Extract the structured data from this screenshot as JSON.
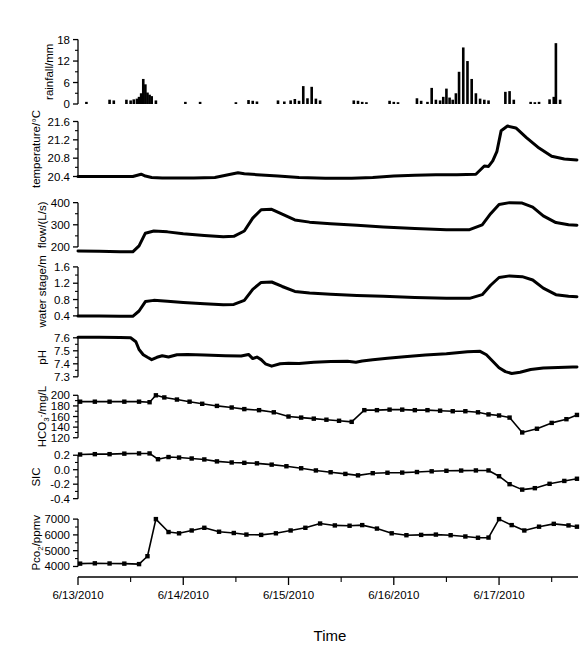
{
  "figure": {
    "time_axis_title": "Time",
    "x_tick_labels": [
      "6/13/2010",
      "6/14/2010",
      "6/15/2010",
      "6/16/2010",
      "6/17/2010"
    ],
    "x_minor_ticks_per_interval": 2
  },
  "chart_data": [
    {
      "type": "bar",
      "title": "",
      "ylabel": "rainfall/mm",
      "xlabel": "Time",
      "ytick_labels": [
        "0",
        "6",
        "12",
        "18"
      ],
      "yticks": [
        0,
        6,
        12,
        18
      ],
      "ylim": [
        0,
        19
      ],
      "xlim": [
        0,
        4.75
      ],
      "grid": false,
      "x": [
        0.08,
        0.3,
        0.34,
        0.46,
        0.5,
        0.53,
        0.56,
        0.58,
        0.6,
        0.62,
        0.64,
        0.66,
        0.68,
        0.7,
        0.74,
        1.02,
        1.16,
        1.5,
        1.62,
        1.66,
        1.7,
        1.9,
        1.96,
        2.02,
        2.06,
        2.1,
        2.14,
        2.18,
        2.22,
        2.26,
        2.3,
        2.62,
        2.66,
        2.7,
        2.74,
        2.96,
        3.0,
        3.04,
        3.22,
        3.26,
        3.32,
        3.36,
        3.4,
        3.44,
        3.47,
        3.5,
        3.53,
        3.56,
        3.59,
        3.62,
        3.66,
        3.7,
        3.74,
        3.78,
        3.82,
        3.86,
        3.9,
        4.06,
        4.1,
        4.14,
        4.3,
        4.34,
        4.38,
        4.48,
        4.52,
        4.54,
        4.58
      ],
      "values": [
        0.6,
        1.2,
        1.0,
        1.2,
        1.0,
        1.3,
        1.5,
        2.0,
        3.0,
        7.0,
        5.5,
        3.2,
        2.6,
        2.2,
        1.0,
        0.6,
        0.6,
        0.5,
        1.1,
        0.9,
        0.7,
        1.0,
        0.7,
        1.0,
        1.4,
        0.9,
        5.0,
        1.6,
        4.8,
        1.5,
        1.0,
        1.0,
        0.9,
        0.6,
        0.5,
        0.9,
        0.6,
        0.5,
        1.6,
        0.9,
        0.6,
        4.5,
        1.2,
        1.0,
        2.0,
        4.3,
        1.8,
        1.2,
        3.0,
        9.0,
        15.8,
        12.0,
        7.0,
        3.0,
        1.5,
        1.2,
        1.0,
        3.4,
        3.6,
        1.2,
        0.6,
        0.5,
        0.6,
        1.3,
        2.0,
        17.0,
        1.2
      ]
    },
    {
      "type": "line",
      "title": "",
      "ylabel": "temperature/°C",
      "ytick_labels": [
        "20.4",
        "20.8",
        "21.2",
        "21.6"
      ],
      "yticks": [
        20.4,
        20.8,
        21.2,
        21.6
      ],
      "ylim": [
        20.28,
        21.72
      ],
      "xlim": [
        0,
        4.75
      ],
      "grid": false,
      "x": [
        0.0,
        0.3,
        0.52,
        0.6,
        0.64,
        0.7,
        0.8,
        0.95,
        1.1,
        1.3,
        1.45,
        1.52,
        1.58,
        1.7,
        1.9,
        2.1,
        2.35,
        2.6,
        2.8,
        3.0,
        3.2,
        3.4,
        3.6,
        3.78,
        3.86,
        3.9,
        3.94,
        3.98,
        4.02,
        4.08,
        4.16,
        4.26,
        4.38,
        4.5,
        4.62,
        4.74
      ],
      "values": [
        20.4,
        20.4,
        20.4,
        20.45,
        20.41,
        20.38,
        20.37,
        20.37,
        20.37,
        20.38,
        20.45,
        20.48,
        20.46,
        20.44,
        20.41,
        20.38,
        20.36,
        20.36,
        20.38,
        20.41,
        20.43,
        20.44,
        20.44,
        20.45,
        20.63,
        20.62,
        20.74,
        20.95,
        21.4,
        21.5,
        21.46,
        21.25,
        21.02,
        20.84,
        20.78,
        20.76
      ]
    },
    {
      "type": "line",
      "title": "",
      "ylabel": "flow/(L/s)",
      "ytick_labels": [
        "200",
        "300",
        "400"
      ],
      "yticks": [
        200,
        300,
        400
      ],
      "ylim": [
        150,
        430
      ],
      "xlim": [
        0,
        4.75
      ],
      "grid": false,
      "x": [
        0.0,
        0.2,
        0.4,
        0.52,
        0.58,
        0.64,
        0.72,
        0.85,
        1.0,
        1.2,
        1.38,
        1.48,
        1.58,
        1.66,
        1.74,
        1.84,
        1.94,
        2.06,
        2.2,
        2.4,
        2.65,
        2.9,
        3.2,
        3.5,
        3.72,
        3.84,
        3.92,
        4.0,
        4.1,
        4.22,
        4.32,
        4.42,
        4.54,
        4.66,
        4.74
      ],
      "values": [
        182,
        180,
        178,
        178,
        205,
        262,
        272,
        268,
        260,
        252,
        246,
        248,
        272,
        330,
        368,
        370,
        348,
        322,
        312,
        305,
        298,
        290,
        283,
        278,
        278,
        300,
        350,
        392,
        400,
        398,
        380,
        340,
        310,
        300,
        298
      ]
    },
    {
      "type": "line",
      "title": "",
      "ylabel": "water stage/m",
      "ytick_labels": [
        "0.4",
        "0.8",
        "1.2",
        "1.6"
      ],
      "yticks": [
        0.4,
        0.8,
        1.2,
        1.6
      ],
      "ylim": [
        0.25,
        1.72
      ],
      "xlim": [
        0,
        4.75
      ],
      "grid": false,
      "x": [
        0.0,
        0.2,
        0.4,
        0.52,
        0.58,
        0.64,
        0.72,
        0.85,
        1.0,
        1.2,
        1.38,
        1.48,
        1.58,
        1.66,
        1.74,
        1.84,
        1.94,
        2.06,
        2.2,
        2.4,
        2.65,
        2.9,
        3.2,
        3.5,
        3.72,
        3.84,
        3.92,
        4.0,
        4.1,
        4.22,
        4.32,
        4.42,
        4.54,
        4.66,
        4.74
      ],
      "values": [
        0.4,
        0.4,
        0.39,
        0.39,
        0.52,
        0.75,
        0.78,
        0.76,
        0.73,
        0.7,
        0.67,
        0.68,
        0.78,
        1.05,
        1.22,
        1.23,
        1.12,
        1.0,
        0.96,
        0.93,
        0.9,
        0.88,
        0.85,
        0.83,
        0.83,
        0.92,
        1.15,
        1.34,
        1.38,
        1.36,
        1.28,
        1.08,
        0.92,
        0.88,
        0.87
      ]
    },
    {
      "type": "line",
      "title": "",
      "ylabel": "pH",
      "ytick_labels": [
        "7.3",
        "7.4",
        "7.5",
        "7.6"
      ],
      "yticks": [
        7.3,
        7.4,
        7.5,
        7.6
      ],
      "ylim": [
        7.26,
        7.66
      ],
      "xlim": [
        0,
        4.75
      ],
      "grid": false,
      "x": [
        0.0,
        0.2,
        0.4,
        0.5,
        0.55,
        0.58,
        0.62,
        0.66,
        0.7,
        0.75,
        0.8,
        0.86,
        0.94,
        1.04,
        1.2,
        1.4,
        1.55,
        1.62,
        1.66,
        1.7,
        1.74,
        1.78,
        1.84,
        1.92,
        2.0,
        2.1,
        2.24,
        2.4,
        2.56,
        2.64,
        2.7,
        2.8,
        2.94,
        3.1,
        3.3,
        3.5,
        3.7,
        3.82,
        3.88,
        3.94,
        4.0,
        4.06,
        4.12,
        4.2,
        4.3,
        4.42,
        4.56,
        4.7,
        4.74
      ],
      "values": [
        7.605,
        7.605,
        7.603,
        7.6,
        7.57,
        7.51,
        7.47,
        7.45,
        7.432,
        7.45,
        7.462,
        7.452,
        7.47,
        7.472,
        7.468,
        7.462,
        7.46,
        7.472,
        7.44,
        7.452,
        7.432,
        7.4,
        7.382,
        7.4,
        7.405,
        7.402,
        7.412,
        7.418,
        7.42,
        7.412,
        7.422,
        7.432,
        7.442,
        7.455,
        7.468,
        7.478,
        7.492,
        7.496,
        7.47,
        7.42,
        7.37,
        7.34,
        7.325,
        7.335,
        7.356,
        7.368,
        7.372,
        7.375,
        7.376
      ]
    },
    {
      "type": "line",
      "title": "",
      "ylabel": "HCO3-/mg/L",
      "ytick_labels": [
        "120",
        "140",
        "160",
        "180",
        "200"
      ],
      "yticks": [
        120,
        140,
        160,
        180,
        200
      ],
      "ylim": [
        112,
        210
      ],
      "xlim": [
        0,
        4.75
      ],
      "grid": false,
      "markers": true,
      "x": [
        0.02,
        0.16,
        0.3,
        0.44,
        0.58,
        0.68,
        0.74,
        0.82,
        0.94,
        1.06,
        1.18,
        1.32,
        1.46,
        1.58,
        1.72,
        1.86,
        2.0,
        2.12,
        2.24,
        2.36,
        2.48,
        2.6,
        2.72,
        2.84,
        2.96,
        3.08,
        3.2,
        3.32,
        3.44,
        3.56,
        3.68,
        3.8,
        3.9,
        4.0,
        4.1,
        4.22,
        4.36,
        4.5,
        4.64,
        4.74
      ],
      "values": [
        188,
        188,
        188,
        188,
        188,
        187,
        200,
        196,
        192,
        188,
        184,
        180,
        177,
        174,
        172,
        168,
        160,
        158,
        156,
        154,
        152,
        150,
        172,
        172,
        173,
        173,
        172,
        172,
        171,
        170,
        170,
        168,
        164,
        162,
        158,
        130,
        137,
        148,
        155,
        163
      ]
    },
    {
      "type": "line",
      "title": "",
      "ylabel": "SIC",
      "ytick_labels": [
        "-0.4",
        "-0.2",
        "0.0",
        "0.2"
      ],
      "yticks": [
        -0.4,
        -0.2,
        0.0,
        0.2
      ],
      "ylim": [
        -0.46,
        0.3
      ],
      "xlim": [
        0,
        4.75
      ],
      "grid": false,
      "markers": true,
      "x": [
        0.02,
        0.16,
        0.3,
        0.44,
        0.58,
        0.68,
        0.76,
        0.86,
        0.96,
        1.08,
        1.2,
        1.32,
        1.46,
        1.58,
        1.7,
        1.84,
        1.98,
        2.12,
        2.26,
        2.4,
        2.54,
        2.66,
        2.8,
        2.94,
        3.08,
        3.22,
        3.36,
        3.5,
        3.64,
        3.78,
        3.9,
        4.0,
        4.1,
        4.22,
        4.34,
        4.48,
        4.62,
        4.74
      ],
      "values": [
        0.21,
        0.215,
        0.215,
        0.222,
        0.225,
        0.225,
        0.145,
        0.175,
        0.168,
        0.155,
        0.142,
        0.115,
        0.1,
        0.095,
        0.088,
        0.07,
        0.048,
        0.02,
        -0.01,
        -0.035,
        -0.058,
        -0.078,
        -0.048,
        -0.042,
        -0.04,
        -0.032,
        -0.022,
        -0.015,
        -0.012,
        -0.01,
        -0.01,
        -0.09,
        -0.2,
        -0.275,
        -0.255,
        -0.195,
        -0.155,
        -0.125
      ]
    },
    {
      "type": "line",
      "title": "",
      "ylabel": "Pco2/ppmv",
      "ytick_labels": [
        "4000",
        "5000",
        "6000",
        "7000"
      ],
      "yticks": [
        4000,
        5000,
        6000,
        7000
      ],
      "ylim": [
        3650,
        7450
      ],
      "xlim": [
        0,
        4.75
      ],
      "grid": false,
      "markers": true,
      "x": [
        0.02,
        0.16,
        0.3,
        0.44,
        0.58,
        0.66,
        0.74,
        0.86,
        0.96,
        1.08,
        1.2,
        1.34,
        1.48,
        1.6,
        1.74,
        1.88,
        2.02,
        2.16,
        2.3,
        2.44,
        2.58,
        2.7,
        2.84,
        2.98,
        3.12,
        3.26,
        3.4,
        3.54,
        3.68,
        3.8,
        3.9,
        4.0,
        4.12,
        4.24,
        4.38,
        4.52,
        4.66,
        4.74
      ],
      "values": [
        4180,
        4200,
        4190,
        4180,
        4150,
        4650,
        7000,
        6180,
        6100,
        6280,
        6450,
        6200,
        6120,
        6020,
        6000,
        6100,
        6280,
        6450,
        6720,
        6600,
        6580,
        6620,
        6400,
        6100,
        5980,
        6000,
        6020,
        5980,
        5900,
        5820,
        5830,
        7000,
        6620,
        6280,
        6520,
        6700,
        6600,
        6520
      ]
    }
  ]
}
